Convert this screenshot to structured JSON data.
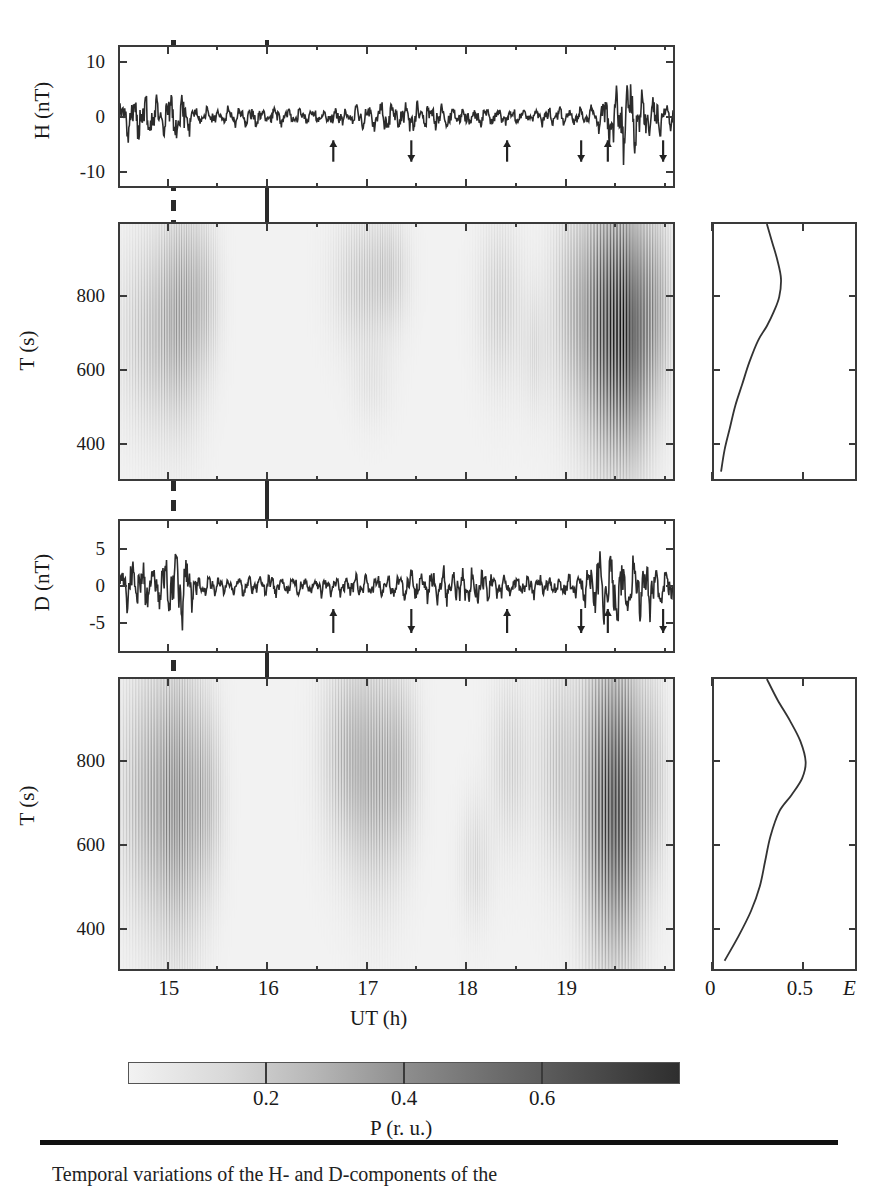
{
  "figure": {
    "xaxis": {
      "label": "UT (h)",
      "ticklabels": [
        "15",
        "16",
        "17",
        "18",
        "19"
      ],
      "tickvalues": [
        15,
        16,
        17,
        18,
        19
      ],
      "range": [
        14.5,
        20.1
      ]
    },
    "markers": {
      "dashed_line_ut": 15.05,
      "solid_line_ut": 16.0
    },
    "colorbar": {
      "label": "P (r. u.)",
      "ticklabels": [
        "0.2",
        "0.4",
        "0.6"
      ],
      "tickvalues": [
        0.2,
        0.4,
        0.6
      ],
      "range": [
        0.0,
        0.8
      ],
      "low_color": "#f2f2f2",
      "high_color": "#2e2e2e"
    },
    "caption": "Temporal variations of the H- and D-components of the"
  },
  "chart_data": [
    {
      "type": "line",
      "name": "H-component time series",
      "title": "",
      "ylabel": "H (nT)",
      "xlabel": "",
      "ylim": [
        -13,
        13
      ],
      "xlim": [
        14.5,
        20.1
      ],
      "yticks": [
        10,
        0,
        -10
      ],
      "yticklabels": [
        "10",
        "0",
        "-10"
      ],
      "grid": false,
      "units": "nT",
      "arrows": [
        {
          "ut": 16.66,
          "dir": "up"
        },
        {
          "ut": 17.45,
          "dir": "down"
        },
        {
          "ut": 18.42,
          "dir": "up"
        },
        {
          "ut": 19.17,
          "dir": "down"
        },
        {
          "ut": 19.44,
          "dir": "up"
        },
        {
          "ut": 20.0,
          "dir": "down"
        }
      ]
    },
    {
      "type": "heatmap",
      "name": "H-component dynamic spectrum",
      "ylabel": "T (s)",
      "xlabel": "",
      "yticks": [
        800,
        600,
        400
      ],
      "yticklabels": [
        "800",
        "600",
        "400"
      ],
      "ylim": [
        300,
        1000
      ],
      "xlim": [
        14.5,
        20.1
      ],
      "zlabel": "P (r. u.)",
      "zlim": [
        0,
        0.8
      ]
    },
    {
      "type": "line",
      "name": "H-component integrated spectrum E",
      "xlabel": "E",
      "ylabel": "",
      "xlim": [
        0,
        0.8
      ],
      "ylim": [
        300,
        1000
      ],
      "xticks": [
        0,
        0.5
      ],
      "xticklabels": [
        "0",
        "0.5"
      ],
      "x": [
        0.3,
        0.33,
        0.36,
        0.38,
        0.37,
        0.34,
        0.3,
        0.25,
        0.2,
        0.16,
        0.12,
        0.09,
        0.06,
        0.04
      ],
      "y": [
        1000,
        950,
        900,
        850,
        800,
        760,
        720,
        680,
        620,
        560,
        500,
        440,
        380,
        320
      ]
    },
    {
      "type": "line",
      "name": "D-component time series",
      "ylabel": "D (nT)",
      "xlabel": "",
      "ylim": [
        -9,
        9
      ],
      "xlim": [
        14.5,
        20.1
      ],
      "yticks": [
        5,
        0,
        -5
      ],
      "yticklabels": [
        "5",
        "0",
        "-5"
      ],
      "grid": false,
      "units": "nT",
      "arrows": [
        {
          "ut": 16.66,
          "dir": "up"
        },
        {
          "ut": 17.45,
          "dir": "down"
        },
        {
          "ut": 18.42,
          "dir": "up"
        },
        {
          "ut": 19.17,
          "dir": "down"
        },
        {
          "ut": 19.44,
          "dir": "up"
        },
        {
          "ut": 20.0,
          "dir": "down"
        }
      ]
    },
    {
      "type": "heatmap",
      "name": "D-component dynamic spectrum",
      "ylabel": "T (s)",
      "xlabel": "UT (h)",
      "yticks": [
        800,
        600,
        400
      ],
      "yticklabels": [
        "800",
        "600",
        "400"
      ],
      "ylim": [
        300,
        1000
      ],
      "xlim": [
        14.5,
        20.1
      ],
      "zlabel": "P (r. u.)",
      "zlim": [
        0,
        0.8
      ]
    },
    {
      "type": "line",
      "name": "D-component integrated spectrum E",
      "xlabel": "E",
      "ylabel": "",
      "xlim": [
        0,
        0.8
      ],
      "ylim": [
        300,
        1000
      ],
      "xticks": [
        0,
        0.5
      ],
      "xticklabels": [
        "0",
        "0.5"
      ],
      "x": [
        0.3,
        0.36,
        0.43,
        0.49,
        0.52,
        0.5,
        0.44,
        0.37,
        0.32,
        0.29,
        0.26,
        0.21,
        0.14,
        0.06
      ],
      "y": [
        1000,
        950,
        900,
        850,
        800,
        760,
        720,
        680,
        620,
        560,
        500,
        440,
        380,
        320
      ]
    }
  ]
}
